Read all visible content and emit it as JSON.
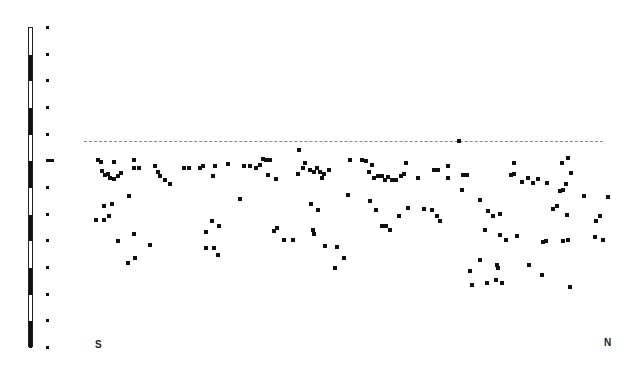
{
  "figure": {
    "type": "cross-section scatter profile",
    "labels": {
      "left": "S",
      "right": "N"
    },
    "colors": {
      "ink": "#111111",
      "background": "#ffffff",
      "surface_line": "#888888"
    }
  },
  "scale_bar": {
    "x": 28,
    "top": 27,
    "bottom": 347,
    "segments": 12,
    "tick_x": 46,
    "ticks_y": [
      27,
      54,
      80,
      107,
      134,
      160,
      187,
      214,
      240,
      267,
      294,
      320,
      347
    ],
    "long_tick_index": 5
  },
  "chart_data": {
    "type": "scatter",
    "title": "",
    "xlabel": "S — N",
    "ylabel": "",
    "x_axis_labels": [
      "S",
      "N"
    ],
    "surface_line_y": 141,
    "points": [
      [
        98,
        160
      ],
      [
        101,
        162
      ],
      [
        114,
        162
      ],
      [
        102,
        171
      ],
      [
        105,
        175
      ],
      [
        108,
        174
      ],
      [
        110,
        178
      ],
      [
        114,
        179
      ],
      [
        118,
        176
      ],
      [
        121,
        173
      ],
      [
        134,
        160
      ],
      [
        134,
        168
      ],
      [
        139,
        168
      ],
      [
        129,
        196
      ],
      [
        112,
        204
      ],
      [
        104,
        206
      ],
      [
        96,
        220
      ],
      [
        104,
        220
      ],
      [
        109,
        216
      ],
      [
        118,
        241
      ],
      [
        134,
        234
      ],
      [
        128,
        263
      ],
      [
        135,
        258
      ],
      [
        150,
        245
      ],
      [
        155,
        166
      ],
      [
        158,
        172
      ],
      [
        160,
        176
      ],
      [
        165,
        180
      ],
      [
        170,
        184
      ],
      [
        184,
        168
      ],
      [
        189,
        168
      ],
      [
        200,
        168
      ],
      [
        203,
        166
      ],
      [
        215,
        166
      ],
      [
        213,
        176
      ],
      [
        228,
        164
      ],
      [
        212,
        221
      ],
      [
        219,
        226
      ],
      [
        206,
        232
      ],
      [
        214,
        248
      ],
      [
        218,
        255
      ],
      [
        206,
        248
      ],
      [
        240,
        199
      ],
      [
        244,
        166
      ],
      [
        250,
        166
      ],
      [
        256,
        168
      ],
      [
        260,
        165
      ],
      [
        263,
        159
      ],
      [
        266,
        160
      ],
      [
        270,
        160
      ],
      [
        268,
        175
      ],
      [
        276,
        179
      ],
      [
        277,
        228
      ],
      [
        274,
        231
      ],
      [
        284,
        240
      ],
      [
        293,
        240
      ],
      [
        299,
        150
      ],
      [
        298,
        174
      ],
      [
        303,
        168
      ],
      [
        305,
        163
      ],
      [
        310,
        170
      ],
      [
        314,
        172
      ],
      [
        317,
        168
      ],
      [
        320,
        172
      ],
      [
        322,
        178
      ],
      [
        324,
        174
      ],
      [
        329,
        170
      ],
      [
        311,
        204
      ],
      [
        318,
        210
      ],
      [
        313,
        230
      ],
      [
        314,
        234
      ],
      [
        325,
        246
      ],
      [
        337,
        247
      ],
      [
        335,
        268
      ],
      [
        344,
        258
      ],
      [
        348,
        195
      ],
      [
        350,
        160
      ],
      [
        362,
        160
      ],
      [
        366,
        161
      ],
      [
        369,
        172
      ],
      [
        372,
        165
      ],
      [
        374,
        178
      ],
      [
        378,
        176
      ],
      [
        382,
        176
      ],
      [
        385,
        180
      ],
      [
        388,
        177
      ],
      [
        392,
        180
      ],
      [
        396,
        180
      ],
      [
        401,
        176
      ],
      [
        404,
        174
      ],
      [
        406,
        163
      ],
      [
        418,
        178
      ],
      [
        434,
        170
      ],
      [
        438,
        170
      ],
      [
        448,
        178
      ],
      [
        448,
        166
      ],
      [
        459,
        141
      ],
      [
        370,
        201
      ],
      [
        376,
        210
      ],
      [
        382,
        226
      ],
      [
        386,
        226
      ],
      [
        390,
        230
      ],
      [
        399,
        216
      ],
      [
        408,
        208
      ],
      [
        424,
        209
      ],
      [
        432,
        210
      ],
      [
        437,
        216
      ],
      [
        440,
        221
      ],
      [
        463,
        175
      ],
      [
        467,
        175
      ],
      [
        462,
        190
      ],
      [
        480,
        200
      ],
      [
        488,
        211
      ],
      [
        493,
        216
      ],
      [
        500,
        214
      ],
      [
        500,
        235
      ],
      [
        506,
        240
      ],
      [
        514,
        163
      ],
      [
        511,
        175
      ],
      [
        514,
        174
      ],
      [
        522,
        182
      ],
      [
        528,
        178
      ],
      [
        533,
        183
      ],
      [
        538,
        179
      ],
      [
        547,
        183
      ],
      [
        485,
        230
      ],
      [
        480,
        260
      ],
      [
        470,
        271
      ],
      [
        497,
        265
      ],
      [
        496,
        280
      ],
      [
        487,
        283
      ],
      [
        502,
        283
      ],
      [
        529,
        265
      ],
      [
        542,
        275
      ],
      [
        543,
        242
      ],
      [
        546,
        241
      ],
      [
        517,
        236
      ],
      [
        553,
        209
      ],
      [
        557,
        206
      ],
      [
        560,
        191
      ],
      [
        563,
        190
      ],
      [
        568,
        158
      ],
      [
        562,
        163
      ],
      [
        571,
        173
      ],
      [
        566,
        184
      ],
      [
        567,
        215
      ],
      [
        584,
        196
      ],
      [
        596,
        221
      ],
      [
        600,
        216
      ],
      [
        608,
        197
      ],
      [
        595,
        237
      ],
      [
        603,
        240
      ],
      [
        570,
        287
      ],
      [
        563,
        241
      ],
      [
        568,
        240
      ],
      [
        472,
        285
      ],
      [
        498,
        268
      ]
    ]
  }
}
